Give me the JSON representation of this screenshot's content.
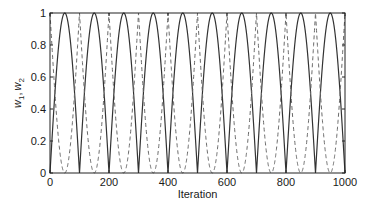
{
  "chart_data": {
    "type": "line",
    "title": "",
    "xlabel": "Iteration",
    "ylabel": "w1, w2",
    "ylabel_parts": {
      "var1": "w",
      "sub1": "1",
      "sep": ",",
      "var2": "w",
      "sub2": "2"
    },
    "xlim": [
      0,
      1000
    ],
    "ylim": [
      0,
      1
    ],
    "xticks": [
      0,
      200,
      400,
      600,
      800,
      1000
    ],
    "yticks": [
      0,
      0.2,
      0.4,
      0.6,
      0.8,
      1
    ],
    "xtick_labels": [
      "0",
      "200",
      "400",
      "600",
      "800",
      "1000"
    ],
    "ytick_labels": [
      "0",
      "0.2",
      "0.4",
      "0.6",
      "0.8",
      "1"
    ],
    "grid": false,
    "legend": null,
    "series": [
      {
        "name": "w1",
        "style": "solid",
        "color": "#333333",
        "description": "|sin(pi * x / 100)|, zeros at multiples of 100, peaks of 1 at 50, 150, ...",
        "x": [
          0,
          25,
          50,
          75,
          100,
          125,
          150,
          175,
          200,
          225,
          250,
          275,
          300,
          325,
          350,
          375,
          400,
          425,
          450,
          475,
          500,
          525,
          550,
          575,
          600,
          625,
          650,
          675,
          700,
          725,
          750,
          775,
          800,
          825,
          850,
          875,
          900,
          925,
          950,
          975,
          1000
        ],
        "values": [
          0,
          0.71,
          1,
          0.71,
          0,
          0.71,
          1,
          0.71,
          0,
          0.71,
          1,
          0.71,
          0,
          0.71,
          1,
          0.71,
          0,
          0.71,
          1,
          0.71,
          0,
          0.71,
          1,
          0.71,
          0,
          0.71,
          1,
          0.71,
          0,
          0.71,
          1,
          0.71,
          0,
          0.71,
          1,
          0.71,
          0,
          0.71,
          1,
          0.71,
          0
        ]
      },
      {
        "name": "w2",
        "style": "dashed",
        "color": "#666666",
        "description": "1 - |sin(pi * x / 100)|, peaks of 1 at multiples of 100, zeros at 50, 150, ...",
        "x": [
          0,
          25,
          50,
          75,
          100,
          125,
          150,
          175,
          200,
          225,
          250,
          275,
          300,
          325,
          350,
          375,
          400,
          425,
          450,
          475,
          500,
          525,
          550,
          575,
          600,
          625,
          650,
          675,
          700,
          725,
          750,
          775,
          800,
          825,
          850,
          875,
          900,
          925,
          950,
          975,
          1000
        ],
        "values": [
          1,
          0.29,
          0,
          0.29,
          1,
          0.29,
          0,
          0.29,
          1,
          0.29,
          0,
          0.29,
          1,
          0.29,
          0,
          0.29,
          1,
          0.29,
          0,
          0.29,
          1,
          0.29,
          0,
          0.29,
          1,
          0.29,
          0,
          0.29,
          1,
          0.29,
          0,
          0.29,
          1,
          0.29,
          0,
          0.29,
          1,
          0.29,
          0,
          0.29,
          1
        ]
      }
    ],
    "period": 100
  }
}
